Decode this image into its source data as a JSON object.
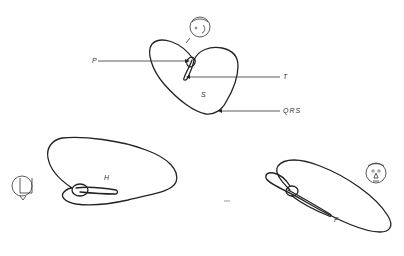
{
  "figure": {
    "type": "vectorcardiogram",
    "planes": {
      "sagittal": {
        "label": "S"
      },
      "horizontal": {
        "label": "H"
      },
      "frontal": {
        "label": "F"
      }
    },
    "annotations": {
      "p_wave": "P",
      "t_wave": "T",
      "qrs": "QRS"
    },
    "icons": {
      "sagittal_view": "head-profile-icon",
      "horizontal_view": "head-top-view-icon",
      "frontal_view": "face-front-icon"
    },
    "colors": {
      "stroke": "#222222",
      "background": "#ffffff"
    }
  }
}
